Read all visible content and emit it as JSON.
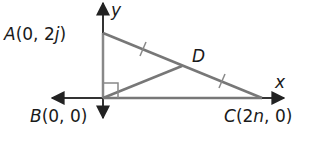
{
  "diagram": {
    "type": "coordinate-geometry",
    "axes": {
      "x_label": "x",
      "y_label": "y"
    },
    "points": {
      "A": {
        "name": "A",
        "coords": "(0, 2j)",
        "label_prefix": "A(0, 2",
        "label_var": "j",
        "label_suffix": ")"
      },
      "B": {
        "name": "B",
        "coords": "(0, 0)",
        "label": "B(0, 0)",
        "label_prefix": "B(0, 0)"
      },
      "C": {
        "name": "C",
        "coords": "(2n, 0)",
        "label_prefix": "C(2",
        "label_var": "n",
        "label_suffix": ", 0)"
      },
      "D": {
        "name": "D",
        "label": "D"
      }
    },
    "segments": [
      "AB",
      "BC",
      "AC",
      "BD"
    ],
    "annotations": {
      "right_angle_at": "B",
      "congruent_marks": [
        "AD",
        "DC"
      ]
    },
    "colors": {
      "axis": "#222222",
      "segment": "#777777",
      "text": "#1a1a1a"
    }
  }
}
